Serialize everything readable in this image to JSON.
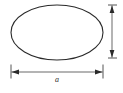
{
  "figure": {
    "kind": "ellipse-dimension-diagram",
    "background_color": "#ffffff",
    "stroke_color": "#2a2a2a",
    "dimension_color": "#2a2a2a"
  },
  "shape": {
    "name": "ellipse",
    "center_x": 57,
    "center_y": 32.5,
    "radius_x": 46,
    "radius_y": 27.5,
    "stroke_width": 1.1
  },
  "dimensions": {
    "major_axis": {
      "label": "a",
      "orientation": "horizontal",
      "line_y": 72,
      "start_x": 11,
      "end_x": 103,
      "extension_top": 64,
      "extension_bottom": 79
    },
    "minor_axis": {
      "label": "",
      "orientation": "vertical",
      "line_x": 112,
      "start_y": 5,
      "end_y": 58,
      "clipped": "true"
    }
  }
}
